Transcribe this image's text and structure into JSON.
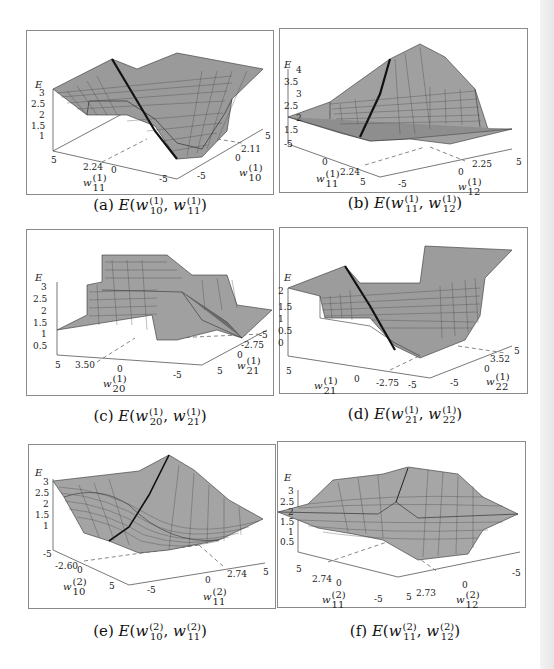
{
  "figure": {
    "panels": [
      {
        "id": "a",
        "caption_prefix": "(a)",
        "caption_func": "E",
        "w_a": {
          "sup": "(1)",
          "sub": "10"
        },
        "w_b": {
          "sup": "(1)",
          "sub": "11"
        },
        "z_label": "E",
        "z_ticks": [
          "3",
          "2.5",
          "2",
          "1.5",
          "1"
        ],
        "left_axis": {
          "label_sub": "11",
          "label_sup": "(1)",
          "ticks": [
            "5",
            "2.24",
            "0",
            "-5"
          ]
        },
        "right_axis": {
          "label_sub": "10",
          "label_sup": "(1)",
          "ticks": [
            "5",
            "2.11",
            "0",
            "-5"
          ]
        }
      },
      {
        "id": "b",
        "caption_prefix": "(b)",
        "caption_func": "E",
        "w_a": {
          "sup": "(1)",
          "sub": "11"
        },
        "w_b": {
          "sup": "(1)",
          "sub": "12"
        },
        "z_label": "E",
        "z_ticks": [
          "4",
          "3.5",
          "3",
          "2.5",
          "2",
          "1.5"
        ],
        "left_axis": {
          "label_sub": "11",
          "label_sup": "(1)",
          "ticks": [
            "-5",
            "0",
            "2.24",
            "5"
          ]
        },
        "right_axis": {
          "label_sub": "12",
          "label_sup": "(1)",
          "ticks": [
            "-5",
            "0",
            "2.25",
            "5"
          ]
        }
      },
      {
        "id": "c",
        "caption_prefix": "(c)",
        "caption_func": "E",
        "w_a": {
          "sup": "(1)",
          "sub": "20"
        },
        "w_b": {
          "sup": "(1)",
          "sub": "21"
        },
        "z_label": "E",
        "z_ticks": [
          "3",
          "2.5",
          "2",
          "1.5",
          "1",
          "0.5"
        ],
        "left_axis": {
          "label_sub": "20",
          "label_sup": "(1)",
          "ticks": [
            "5",
            "3.50",
            "0",
            "-5"
          ]
        },
        "right_axis": {
          "label_sub": "21",
          "label_sup": "(1)",
          "ticks": [
            "-5",
            "-2.75",
            "0",
            "5"
          ]
        }
      },
      {
        "id": "d",
        "caption_prefix": "(d)",
        "caption_func": "E",
        "w_a": {
          "sup": "(1)",
          "sub": "21"
        },
        "w_b": {
          "sup": "(1)",
          "sub": "22"
        },
        "z_label": "E",
        "z_ticks": [
          "2",
          "1.5",
          "1",
          "0.5",
          "0"
        ],
        "left_axis": {
          "label_sub": "21",
          "label_sup": "(1)",
          "ticks": [
            "5",
            "0",
            "-2.75",
            "-5"
          ]
        },
        "right_axis": {
          "label_sub": "22",
          "label_sup": "(1)",
          "ticks": [
            "5",
            "3.52",
            "0",
            "-5"
          ]
        }
      },
      {
        "id": "e",
        "caption_prefix": "(e)",
        "caption_func": "E",
        "w_a": {
          "sup": "(2)",
          "sub": "10"
        },
        "w_b": {
          "sup": "(2)",
          "sub": "11"
        },
        "z_label": "E",
        "z_ticks": [
          "3",
          "2.5",
          "2",
          "1.5",
          "1"
        ],
        "left_axis": {
          "label_sub": "10",
          "label_sup": "(2)",
          "ticks": [
            "-5",
            "-2.60",
            "0",
            "5"
          ]
        },
        "right_axis": {
          "label_sub": "11",
          "label_sup": "(2)",
          "ticks": [
            "-5",
            "0",
            "2.74",
            "5"
          ]
        }
      },
      {
        "id": "f",
        "caption_prefix": "(f)",
        "caption_func": "E",
        "w_a": {
          "sup": "(2)",
          "sub": "11"
        },
        "w_b": {
          "sup": "(2)",
          "sub": "12"
        },
        "z_label": "E",
        "z_ticks": [
          "3",
          "2.5",
          "2",
          "1.5",
          "1",
          "0.5"
        ],
        "left_axis": {
          "label_sub": "11",
          "label_sup": "(2)",
          "ticks": [
            "5",
            "2.74",
            "0",
            "-5"
          ]
        },
        "right_axis": {
          "label_sub": "12",
          "label_sup": "(2)",
          "ticks": [
            "5",
            "2.73",
            "0",
            "-5"
          ]
        }
      }
    ],
    "axis_variable": "w"
  }
}
